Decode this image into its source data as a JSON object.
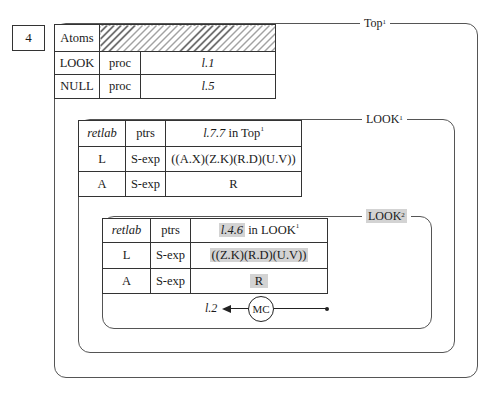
{
  "figure_number": "4",
  "frames": {
    "top": {
      "label": "Top",
      "superscript": "1"
    },
    "look1": {
      "label": "LOOK",
      "superscript": "1"
    },
    "look2": {
      "label": "LOOK",
      "superscript": "2"
    }
  },
  "atoms_table": {
    "header": "Atoms",
    "rows": [
      {
        "name": "LOOK",
        "type": "proc",
        "value": "l.1"
      },
      {
        "name": "NULL",
        "type": "proc",
        "value": "l.5"
      }
    ]
  },
  "look1_table": {
    "header": {
      "col1": "retlab",
      "col2": "ptrs",
      "col3_ref": "l.7.7",
      "col3_in": " in Top",
      "col3_sup": "1"
    },
    "rows": [
      {
        "name": "L",
        "type": "S-exp",
        "value": "((A.X)(Z.K)(R.D)(U.V))"
      },
      {
        "name": "A",
        "type": "S-exp",
        "value": "R"
      }
    ]
  },
  "look2_table": {
    "header": {
      "col1": "retlab",
      "col2": "ptrs",
      "col3_ref": "l.4.6",
      "col3_in": " in LOOK",
      "col3_sup": "1"
    },
    "rows": [
      {
        "name": "L",
        "type": "S-exp",
        "value": "((Z.K)(R.D)(U.V))"
      },
      {
        "name": "A",
        "type": "S-exp",
        "value": "R"
      }
    ]
  },
  "control": {
    "node_label": "MC",
    "return_label": "l.2"
  },
  "colors": {
    "highlight": "#d3d3d3",
    "line": "#333333"
  }
}
